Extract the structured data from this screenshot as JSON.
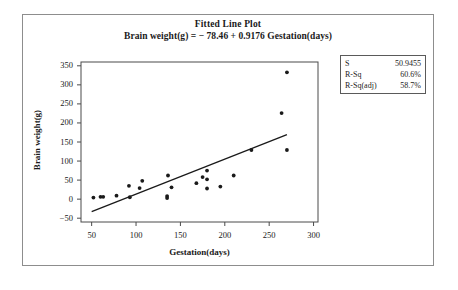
{
  "figure": {
    "title": "Fitted Line Plot",
    "subtitle": "Brain weight(g) = − 78.46 + 0.9176 Gestation(days)",
    "border_color": "#8d8d8d",
    "background": "#ffffff"
  },
  "stats_box": {
    "rows": [
      {
        "label": "S",
        "value": "50.9455"
      },
      {
        "label": "R-Sq",
        "value": "60.6%"
      },
      {
        "label": "R-Sq(adj)",
        "value": "58.7%"
      }
    ]
  },
  "axes": {
    "x_title": "Gestation(days)",
    "y_title": "Brain weight(g)",
    "x_ticks": [
      "50",
      "100",
      "150",
      "200",
      "250",
      "300"
    ],
    "y_ticks": [
      "350",
      "300",
      "250",
      "200",
      "150",
      "100",
      "50",
      "0",
      "−50"
    ]
  },
  "chart_data": {
    "type": "scatter",
    "title": "Fitted Line Plot",
    "subtitle": "Brain weight(g) = − 78.46 + 0.9176 Gestation(days)",
    "xlabel": "Gestation(days)",
    "ylabel": "Brain weight(g)",
    "xlim": [
      38,
      305
    ],
    "ylim": [
      -60,
      360
    ],
    "xticks": [
      50,
      100,
      150,
      200,
      250,
      300
    ],
    "yticks": [
      -50,
      0,
      50,
      100,
      150,
      200,
      250,
      300,
      350
    ],
    "grid": false,
    "legend": false,
    "marker_color": "#1a1a1a",
    "line_color": "#1a1a1a",
    "points": [
      {
        "x": 52,
        "y": 4
      },
      {
        "x": 60,
        "y": 6
      },
      {
        "x": 63,
        "y": 6
      },
      {
        "x": 78,
        "y": 9
      },
      {
        "x": 92,
        "y": 35
      },
      {
        "x": 93,
        "y": 5
      },
      {
        "x": 104,
        "y": 29
      },
      {
        "x": 107,
        "y": 48
      },
      {
        "x": 135,
        "y": 8
      },
      {
        "x": 135,
        "y": 3
      },
      {
        "x": 136,
        "y": 62
      },
      {
        "x": 140,
        "y": 31
      },
      {
        "x": 168,
        "y": 42
      },
      {
        "x": 175,
        "y": 58
      },
      {
        "x": 180,
        "y": 75
      },
      {
        "x": 180,
        "y": 52
      },
      {
        "x": 180,
        "y": 28
      },
      {
        "x": 195,
        "y": 33
      },
      {
        "x": 210,
        "y": 62
      },
      {
        "x": 230,
        "y": 129
      },
      {
        "x": 264,
        "y": 226
      },
      {
        "x": 270,
        "y": 333
      },
      {
        "x": 270,
        "y": 129
      }
    ],
    "fit_line": {
      "intercept": -78.46,
      "slope": 0.9176,
      "x_start": 50,
      "x_end": 270,
      "equation": "Brain weight(g) = − 78.46 + 0.9176 Gestation(days)"
    },
    "statistics": {
      "S": "50.9455",
      "R_Sq": "60.6%",
      "R_Sq_adj": "58.7%"
    }
  }
}
